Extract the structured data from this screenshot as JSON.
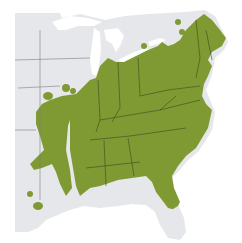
{
  "map": {
    "title": "",
    "region": "Eastern United States",
    "colors": {
      "background": "#ffffff",
      "land": "#e6e7ea",
      "range": "#7f9a33",
      "borders": "#3a4a1c",
      "land_borders": "#7a7d85",
      "water": "#ffffff"
    },
    "legend": []
  }
}
